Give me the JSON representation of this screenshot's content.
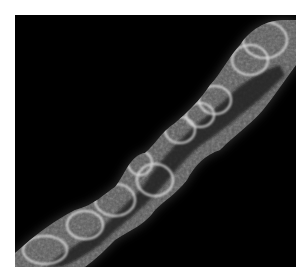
{
  "image": {
    "description": "Grayscale microscopy image of a diagonal elongated cellular structure on black background",
    "background_color": "#000000",
    "page_background": "#ffffff",
    "subject_color": "#d8d8d8"
  }
}
